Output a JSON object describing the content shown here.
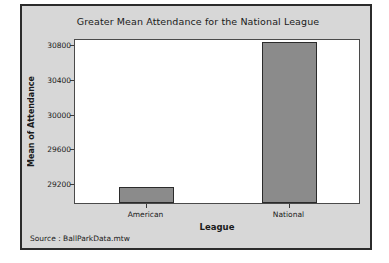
{
  "figure": {
    "background_color": "#d7d7d7",
    "border_color": "#2b2b2b",
    "plot_background_color": "#ffffff"
  },
  "footnote": "Source : BallParkData.mtw",
  "chart_data": {
    "type": "bar",
    "title": "Greater Mean Attendance for the National League",
    "xlabel": "League",
    "ylabel": "Mean of Attendance",
    "categories": [
      "American",
      "National"
    ],
    "values": [
      29150,
      30830
    ],
    "series": [
      {
        "name": "Mean of Attendance",
        "values": [
          29150,
          30830
        ],
        "color": "#8b8b8b"
      }
    ],
    "ylim": [
      28970,
      30875
    ],
    "yticks": [
      29200,
      29600,
      30000,
      30400,
      30800
    ],
    "ytick_labels": [
      "29200",
      "29600",
      "30000",
      "30400",
      "30800"
    ],
    "xtick_labels": [
      "American",
      "National"
    ],
    "grid": false,
    "legend": "none",
    "bar_color": "#8b8b8b",
    "bar_edge_color": "#2b2b2b"
  }
}
